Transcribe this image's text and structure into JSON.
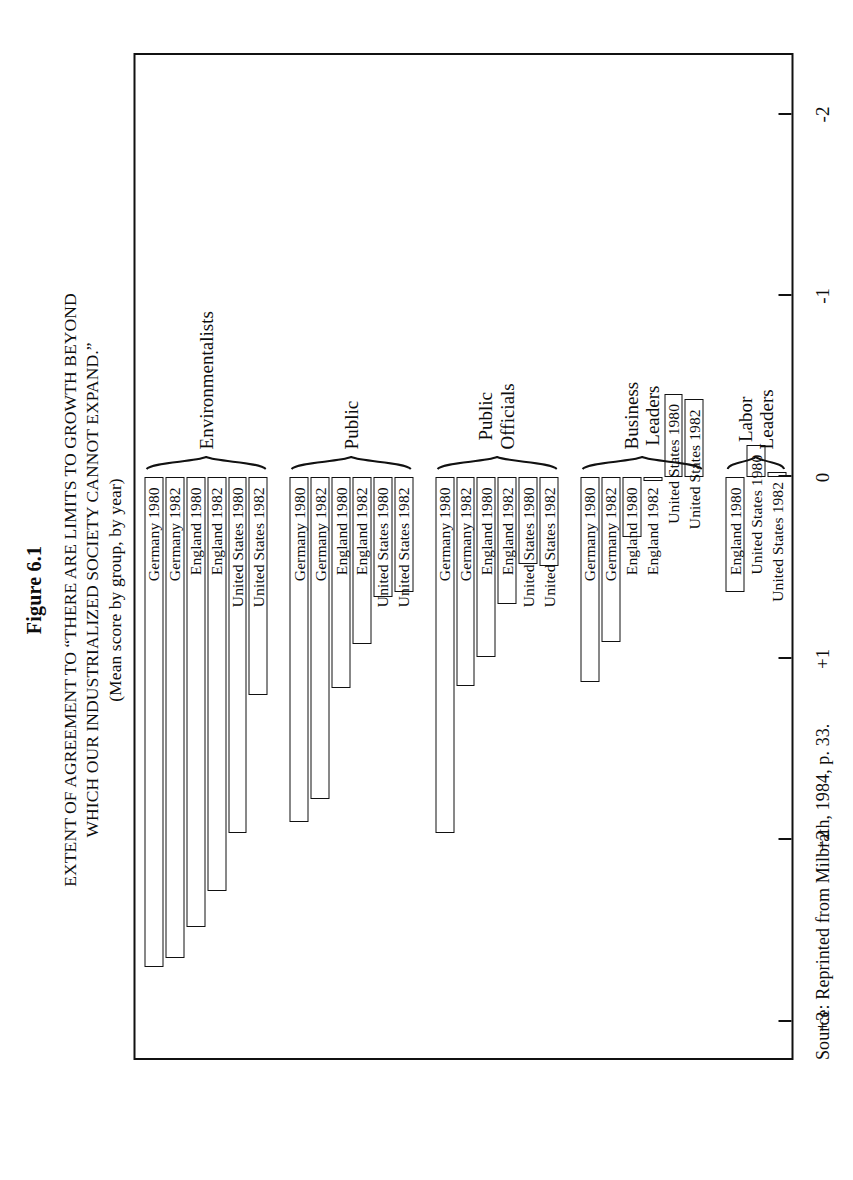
{
  "figure": {
    "number": "Figure 6.1",
    "title_line1": "EXTENT OF AGREEMENT TO “THERE ARE LIMITS TO GROWTH BEYOND",
    "title_line2": "WHICH OUR INDUSTRIALIZED SOCIETY CANNOT EXPAND.”",
    "subtitle": "(Mean score by group, by year)",
    "source": "Source:  Reprinted from Milbrath, 1984, p. 33."
  },
  "axis": {
    "ticks": [
      {
        "number": "+3",
        "word_line1": "Strongly",
        "word_line2": "Agree",
        "value": 3
      },
      {
        "number": "+2",
        "word_line1": "Moderately",
        "word_line2": "Agree",
        "value": 2
      },
      {
        "number": "+1",
        "word_line1": "Somewhat",
        "word_line2": "Agree",
        "value": 1
      },
      {
        "number": "0",
        "word_line1": "Neutral",
        "word_line2": "",
        "value": 0
      },
      {
        "number": "-1",
        "word_line1": "Somewhat",
        "word_line2": "Disagree",
        "value": -1
      },
      {
        "number": "-2",
        "word_line1": "Moderately",
        "word_line2": "Disagree",
        "value": -2
      }
    ],
    "min": -2.35,
    "max": 3.2
  },
  "chart_data": {
    "type": "bar",
    "title": "EXTENT OF AGREEMENT TO “THERE ARE LIMITS TO GROWTH BEYOND WHICH OUR INDUSTRIALIZED SOCIETY CANNOT EXPAND.”",
    "subtitle": "(Mean score by group, by year)",
    "xlabel": "",
    "ylabel": "Mean score",
    "ylim": [
      -2.35,
      3.2
    ],
    "grid": false,
    "legend": "none",
    "orientation": "horizontal",
    "axis_ticks": [
      3,
      2,
      1,
      0,
      -1,
      -2
    ],
    "axis_tick_labels": [
      "+3",
      "+2",
      "+1",
      "0",
      "-1",
      "-2"
    ],
    "axis_tick_words": [
      "Strongly Agree",
      "Moderately Agree",
      "Somewhat Agree",
      "Neutral",
      "Somewhat Disagree",
      "Moderately Disagree"
    ],
    "groups": [
      {
        "name": "Environmentalists",
        "name_line1": "Environmentalists",
        "name_line2": "",
        "bars": [
          {
            "label": "Germany 1980",
            "value": 2.7
          },
          {
            "label": "Germany 1982",
            "value": 2.65
          },
          {
            "label": "England 1980",
            "value": 2.48
          },
          {
            "label": "England 1982",
            "value": 2.28
          },
          {
            "label": "United States 1980",
            "value": 1.96
          },
          {
            "label": "United States 1982",
            "value": 1.2
          }
        ]
      },
      {
        "name": "Public",
        "name_line1": "Public",
        "name_line2": "",
        "bars": [
          {
            "label": "Germany 1980",
            "value": 1.9
          },
          {
            "label": "Germany 1982",
            "value": 1.77
          },
          {
            "label": "England 1980",
            "value": 1.16
          },
          {
            "label": "England 1982",
            "value": 0.92
          },
          {
            "label": "United States 1980",
            "value": 0.66
          },
          {
            "label": "United States 1982",
            "value": 0.63
          }
        ]
      },
      {
        "name": "Public Officials",
        "name_line1": "Public",
        "name_line2": "Officials",
        "bars": [
          {
            "label": "Germany 1980",
            "value": 1.96
          },
          {
            "label": "Germany 1982",
            "value": 1.15
          },
          {
            "label": "England 1980",
            "value": 0.99
          },
          {
            "label": "England 1982",
            "value": 0.7
          },
          {
            "label": "United States 1980",
            "value": 0.48
          },
          {
            "label": "United States 1982",
            "value": 0.49
          }
        ]
      },
      {
        "name": "Business Leaders",
        "name_line1": "Business",
        "name_line2": "Leaders",
        "bars": [
          {
            "label": "Germany 1980",
            "value": 1.13
          },
          {
            "label": "Germany 1982",
            "value": 0.91
          },
          {
            "label": "England 1980",
            "value": 0.33
          },
          {
            "label": "England 1982",
            "value": 0.02
          },
          {
            "label": "United States 1980",
            "value": -0.46
          },
          {
            "label": "United States 1982",
            "value": -0.43
          }
        ]
      },
      {
        "name": "Labor Leaders",
        "name_line1": "Labor",
        "name_line2": "Leaders",
        "bars": [
          {
            "label": "England 1980",
            "value": 0.63
          },
          {
            "label": "United States 1980",
            "value": -0.18
          },
          {
            "label": "United States 1982",
            "value": -0.03
          }
        ]
      }
    ]
  }
}
